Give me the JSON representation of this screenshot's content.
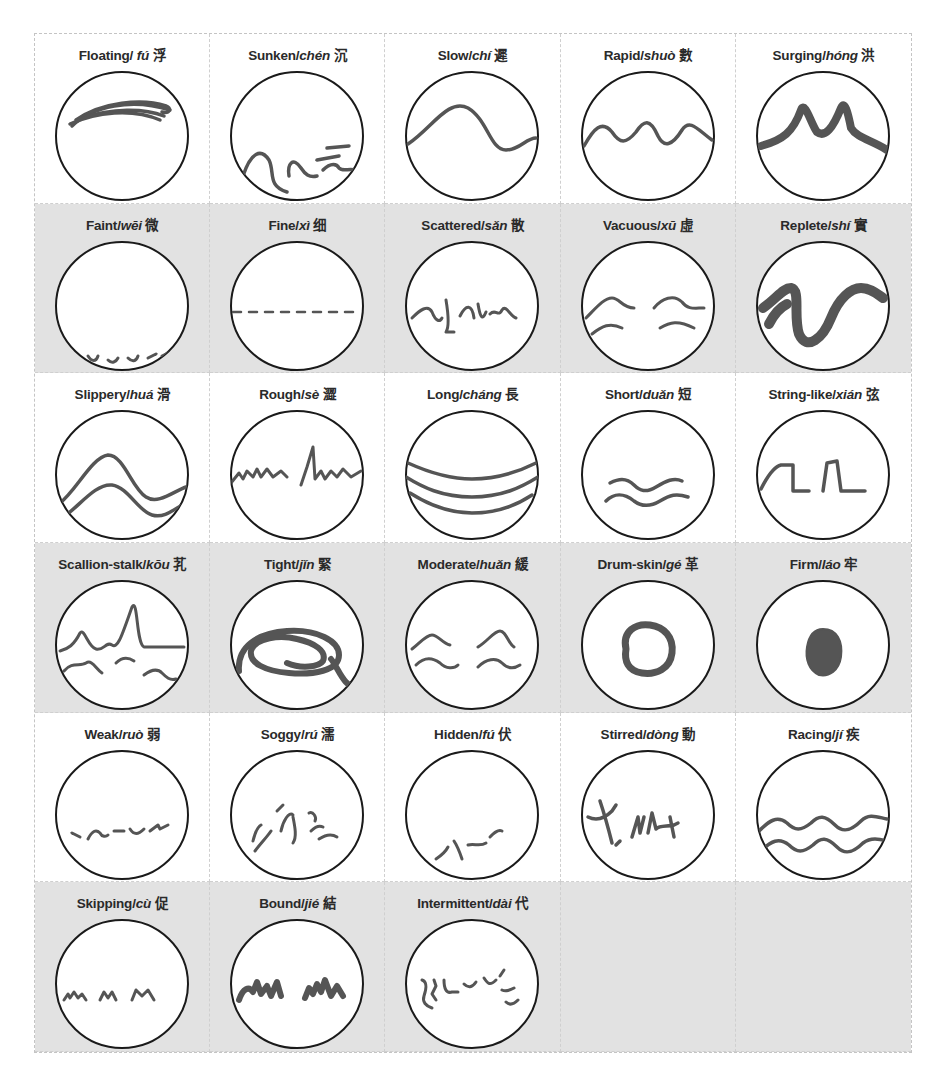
{
  "figure": {
    "title": "",
    "caption_partial": "",
    "colors": {
      "stroke_pulse": "#555555",
      "circle_outline": "#1a1a1a",
      "band_white": "#ffffff",
      "band_gray": "#e2e2e2",
      "grid_line": "#cfcfcf"
    }
  },
  "cells": [
    {
      "en": "Floating/ ",
      "pinyin": "fú",
      "zh": "浮",
      "shape": "floating"
    },
    {
      "en": "Sunken/",
      "pinyin": "chén",
      "zh": "沉",
      "shape": "sunken"
    },
    {
      "en": "Slow/",
      "pinyin": "chí",
      "zh": "遲",
      "shape": "slow"
    },
    {
      "en": "Rapid/",
      "pinyin": "shuò",
      "zh": "數",
      "shape": "rapid"
    },
    {
      "en": "Surging/",
      "pinyin": "hóng",
      "zh": "洪",
      "shape": "surging"
    },
    {
      "en": "Faint/",
      "pinyin": "wēi",
      "zh": "微",
      "shape": "faint"
    },
    {
      "en": "Fine/",
      "pinyin": "xì",
      "zh": "细",
      "shape": "fine"
    },
    {
      "en": "Scattered/",
      "pinyin": "sǎn",
      "zh": "散",
      "shape": "scattered"
    },
    {
      "en": "Vacuous/",
      "pinyin": "xū",
      "zh": "虛",
      "shape": "vacuous"
    },
    {
      "en": "Replete/",
      "pinyin": "shí",
      "zh": "實",
      "shape": "replete"
    },
    {
      "en": "Slippery/",
      "pinyin": "huá",
      "zh": "滑",
      "shape": "slippery"
    },
    {
      "en": "Rough/",
      "pinyin": "sè",
      "zh": "澀",
      "shape": "rough"
    },
    {
      "en": "Long/",
      "pinyin": "cháng",
      "zh": "長",
      "shape": "long"
    },
    {
      "en": "Short/",
      "pinyin": "duǎn",
      "zh": "短",
      "shape": "short"
    },
    {
      "en": "String-like/",
      "pinyin": "xián",
      "zh": "弦",
      "shape": "string"
    },
    {
      "en": "Scallion-stalk/",
      "pinyin": "kōu",
      "zh": "芤",
      "shape": "scallion"
    },
    {
      "en": "Tight/",
      "pinyin": "jǐn",
      "zh": "緊",
      "shape": "tight"
    },
    {
      "en": "Moderate/",
      "pinyin": "huǎn",
      "zh": "緩",
      "shape": "moderate"
    },
    {
      "en": "Drum-skin/",
      "pinyin": "gé",
      "zh": "革",
      "shape": "drum"
    },
    {
      "en": "Firm/",
      "pinyin": "láo",
      "zh": "牢",
      "shape": "firm"
    },
    {
      "en": "Weak/",
      "pinyin": "ruò",
      "zh": "弱",
      "shape": "weak"
    },
    {
      "en": "Soggy/",
      "pinyin": "rú",
      "zh": "濡",
      "shape": "soggy"
    },
    {
      "en": "Hidden/",
      "pinyin": "fú",
      "zh": "伏",
      "shape": "hidden"
    },
    {
      "en": "Stirred/",
      "pinyin": "dòng",
      "zh": "動",
      "shape": "stirred"
    },
    {
      "en": "Racing/",
      "pinyin": "jí",
      "zh": "疾",
      "shape": "racing"
    },
    {
      "en": "Skipping/",
      "pinyin": "cù",
      "zh": "促",
      "shape": "skipping"
    },
    {
      "en": "Bound/",
      "pinyin": "jié",
      "zh": "結",
      "shape": "bound"
    },
    {
      "en": "Intermittent/",
      "pinyin": "dài",
      "zh": "代",
      "shape": "intermittent"
    },
    {
      "en": "",
      "pinyin": "",
      "zh": "",
      "shape": "empty"
    },
    {
      "en": "",
      "pinyin": "",
      "zh": "",
      "shape": "empty"
    }
  ]
}
